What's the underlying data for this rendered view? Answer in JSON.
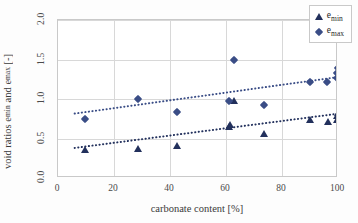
{
  "chart_data": {
    "type": "scatter",
    "title": "",
    "xlabel": "carbonate content [%]",
    "ylabel": "void ratios e_min and e_max [-]",
    "xlim": [
      0,
      100
    ],
    "ylim": [
      0.0,
      2.0
    ],
    "xticks": [
      "0",
      "20",
      "40",
      "60",
      "80",
      "100"
    ],
    "xtick_values": [
      0,
      20,
      40,
      60,
      80,
      100
    ],
    "yticks": [
      "0.0",
      "0.5",
      "1.0",
      "1.5",
      "2.0"
    ],
    "ytick_values": [
      0.0,
      0.5,
      1.0,
      1.5,
      2.0
    ],
    "grid": true,
    "legend_position": "top-right",
    "series": [
      {
        "name": "e_min",
        "label_base": "e",
        "label_sub": "min",
        "marker": "triangle",
        "color": "#22305c",
        "points": [
          {
            "x": 9.5,
            "y": 0.35
          },
          {
            "x": 28.5,
            "y": 0.37
          },
          {
            "x": 42.5,
            "y": 0.4
          },
          {
            "x": 61.0,
            "y": 0.65
          },
          {
            "x": 61.5,
            "y": 0.67
          },
          {
            "x": 63.0,
            "y": 0.97
          },
          {
            "x": 73.5,
            "y": 0.56
          },
          {
            "x": 90.0,
            "y": 0.74
          },
          {
            "x": 96.5,
            "y": 0.71
          },
          {
            "x": 99.5,
            "y": 0.73
          },
          {
            "x": 99.8,
            "y": 0.78
          },
          {
            "x": 100.0,
            "y": 0.82
          }
        ]
      },
      {
        "name": "e_max",
        "label_base": "e",
        "label_sub": "max",
        "marker": "diamond",
        "color": "#3a4d86",
        "points": [
          {
            "x": 9.5,
            "y": 0.75
          },
          {
            "x": 28.5,
            "y": 1.0
          },
          {
            "x": 42.5,
            "y": 0.84
          },
          {
            "x": 61.0,
            "y": 0.97
          },
          {
            "x": 63.0,
            "y": 1.5
          },
          {
            "x": 73.5,
            "y": 0.92
          },
          {
            "x": 90.0,
            "y": 1.22
          },
          {
            "x": 96.0,
            "y": 1.21
          },
          {
            "x": 99.5,
            "y": 1.26
          },
          {
            "x": 99.8,
            "y": 1.33
          },
          {
            "x": 100.0,
            "y": 1.39
          }
        ]
      }
    ],
    "trendlines": [
      {
        "name": "e_min-trend",
        "style": "dotted",
        "color": "#22305c",
        "x1": 6,
        "y1": 0.36,
        "x2": 101,
        "y2": 0.8
      },
      {
        "name": "e_max-trend",
        "style": "dotted",
        "color": "#3a4d86",
        "x1": 6,
        "y1": 0.8,
        "x2": 101,
        "y2": 1.27
      }
    ]
  }
}
